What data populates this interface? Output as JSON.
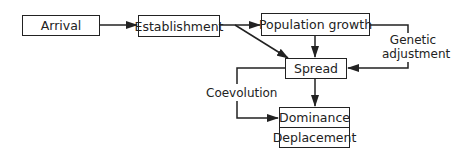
{
  "diagram": {
    "nodes": {
      "arrival": "Arrival",
      "establishment": "Establishment",
      "population_growth": "Population growth",
      "spread": "Spread",
      "dominance": "Dominance",
      "deplacement": "Deplacement"
    },
    "edge_labels": {
      "genetic_line1": "Genetic",
      "genetic_line2": "adjustment",
      "coevolution": "Coevolution"
    },
    "edges": [
      {
        "from": "Arrival",
        "to": "Establishment"
      },
      {
        "from": "Establishment",
        "to": "Population growth"
      },
      {
        "from": "Establishment",
        "to": "Spread"
      },
      {
        "from": "Population growth",
        "to": "Spread"
      },
      {
        "from": "Population growth",
        "to": "Spread",
        "label": "Genetic adjustment"
      },
      {
        "from": "Spread",
        "to": "Dominance/Deplacement"
      },
      {
        "from": "Spread",
        "to": "Dominance/Deplacement",
        "label": "Coevolution"
      }
    ]
  }
}
